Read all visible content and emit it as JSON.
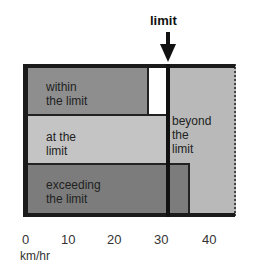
{
  "title": "limit",
  "rows": [
    {
      "label_line1": "within",
      "label_line2": "the limit"
    },
    {
      "label_line1": "at the",
      "label_line2": "limit"
    },
    {
      "label_line1": "exceeding",
      "label_line2": "the limit"
    }
  ],
  "beyond": {
    "line1": "beyond",
    "line2": "the",
    "line3": "limit"
  },
  "axis": {
    "ticks": [
      "0",
      "10",
      "20",
      "30",
      "40"
    ],
    "unit": "km/hr"
  },
  "colors": {
    "within": "#8e8e8e",
    "at": "#c4c4c4",
    "exceeding": "#7c7c7c",
    "beyond": "#b9b9b9",
    "line": "#111111"
  }
}
